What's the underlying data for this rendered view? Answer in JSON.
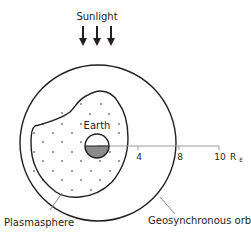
{
  "diagram": {
    "labels": {
      "sunlight": "Sunlight",
      "earth": "Earth",
      "plasmasphere": "Plasmasphere",
      "geosynchronous_orbit": "Geosynchronous orbit"
    },
    "axis": {
      "ticks": [
        "4",
        "8",
        "10"
      ],
      "unit_base": "R",
      "unit_sub": "E"
    },
    "icons": {
      "sunlight_arrows": "down-arrow-icon",
      "earth": "earth-circle-icon"
    },
    "colors": {
      "stroke": "#231f20",
      "earth_shadow": "#8a8a8a",
      "axis": "#9a9a9a",
      "leader": "#6d6e71"
    }
  }
}
